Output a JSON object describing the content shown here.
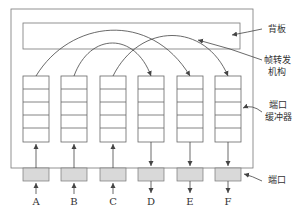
{
  "diagram": {
    "labels": {
      "backplane": "背板",
      "forwarding_line1": "帧转发",
      "forwarding_line2": "机构",
      "buffer_line1": "端口",
      "buffer_line2": "缓冲器",
      "port": "端口"
    },
    "ports": [
      {
        "name": "A",
        "direction": "in"
      },
      {
        "name": "B",
        "direction": "in"
      },
      {
        "name": "C",
        "direction": "in"
      },
      {
        "name": "D",
        "direction": "out"
      },
      {
        "name": "E",
        "direction": "out"
      },
      {
        "name": "F",
        "direction": "out"
      }
    ],
    "forwarding_paths": [
      {
        "from": "A",
        "to": "E"
      },
      {
        "from": "B",
        "to": "D"
      },
      {
        "from": "C",
        "to": "F"
      }
    ],
    "buffer_slots_per_port": 5,
    "colors": {
      "line": "#555555",
      "port_fill": "#d9d9d9"
    }
  }
}
